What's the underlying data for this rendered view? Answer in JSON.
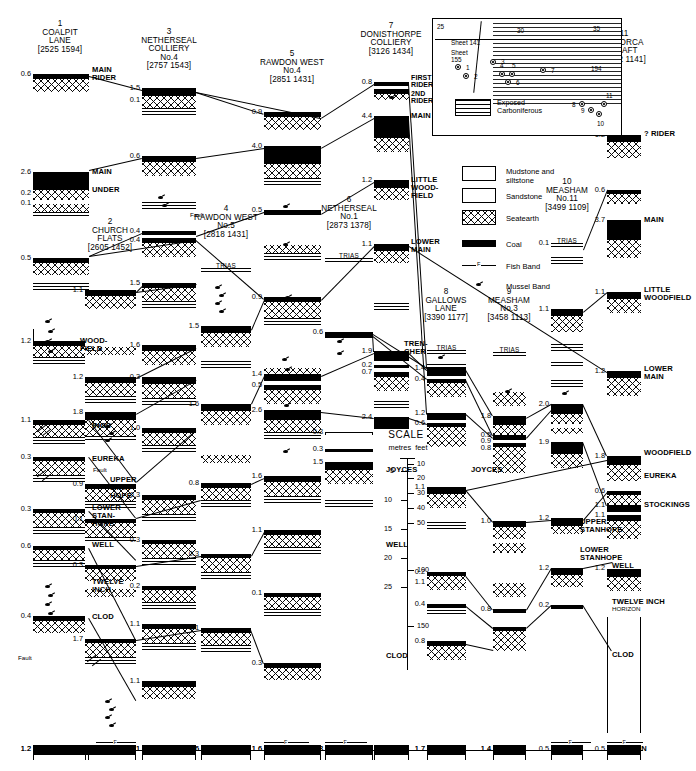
{
  "figure": {
    "type": "geological-seam-correlation-diagram",
    "scale": {
      "title": "SCALE",
      "unit_labels": [
        "metres",
        "feet"
      ],
      "metres_ticks": [
        "5",
        "10",
        "15",
        "20",
        "25"
      ],
      "feet_ticks": [
        "10",
        "20",
        "30",
        "40",
        "50",
        "100",
        "150"
      ]
    }
  },
  "legend": {
    "items": [
      {
        "key": "mudstone",
        "label": "Mudstone and\nsiltstone"
      },
      {
        "key": "sandstone",
        "label": "Sandstone"
      },
      {
        "key": "seatearth",
        "label": "Seatearth"
      },
      {
        "key": "coal",
        "label": "Coal"
      },
      {
        "key": "fish-band",
        "label": "Fish Band"
      },
      {
        "key": "mussel-band",
        "label": "Mussel Band"
      }
    ]
  },
  "map_inset": {
    "sheet_labels": [
      "Sheet 141",
      "Sheet 155"
    ],
    "grid_labels": [
      "25",
      "30",
      "35",
      "15",
      "194"
    ],
    "exposed_label": "Exposed\nCarboniferous",
    "site_numbers": [
      "1",
      "2",
      "3",
      "4",
      "5",
      "6",
      "7",
      "8",
      "9",
      "10",
      "11"
    ]
  },
  "columns": [
    {
      "no": "1",
      "name": "COALPIT\nLANE",
      "grid": "[2525 1594]",
      "trias": false,
      "top_values": [],
      "values": [
        "0.6",
        "2.6",
        "0.2",
        "0.1",
        "0.5",
        "1.2",
        "1.1",
        "0.3",
        "0.3",
        "0.6",
        "0.2",
        "0.4",
        "1.2"
      ]
    },
    {
      "no": "2",
      "name": "CHURCH\nFLATS",
      "grid": "[2605 1452]",
      "trias": false,
      "values": [
        "1.1",
        "1.2",
        "1.8",
        "0.9",
        "0.1",
        "0.3",
        "0.3",
        "0.9",
        "1.7",
        "0.7"
      ]
    },
    {
      "no": "3",
      "name": "NETHERSEAL\nCOLLIERY\nNo.4",
      "grid": "[2757 1543]",
      "trias": false,
      "values": [
        "1.5",
        "0.1",
        "0.6",
        "0.4",
        "0.4",
        "1.5",
        "1.6",
        "0.3",
        "1.0",
        "0.3",
        "0.3",
        "0.2",
        "1.1"
      ]
    },
    {
      "no": "4",
      "name": "RAWDON WEST\nNo.5",
      "grid": "[2818 1431]",
      "trias": true,
      "values": [
        "1.5",
        "1.6",
        "0.8",
        "0.3",
        "1.1",
        "0.3",
        "0.2",
        "1.6"
      ]
    },
    {
      "no": "5",
      "name": "RAWDON WEST\nNo.4",
      "grid": "[2851 1431]",
      "trias": false,
      "values": [
        "0.9",
        "4.0",
        "0.5",
        "0.9",
        "1.4",
        "0.5",
        "2.6",
        "1.6",
        "1.1",
        "0.1",
        "0.3",
        "1.6"
      ]
    },
    {
      "no": "6",
      "name": "NETHERSEAL\nNo.1",
      "grid": "[2873 1378]",
      "trias": true,
      "values": [
        "0.6",
        "0.3",
        "0.3",
        "1.5",
        "0.3"
      ]
    },
    {
      "no": "7",
      "name": "DONISTHORPE\nCOLLIERY",
      "grid": "[3126 1434]",
      "trias": false,
      "values": [
        "0.8",
        "4.4",
        "1.2",
        "1.1",
        "1.9",
        "0.2",
        "0.7",
        "2.4"
      ]
    },
    {
      "no": "8",
      "name": "GALLOWS\nLANE",
      "grid": "[3390 1177]",
      "trias": true,
      "values": [
        "1.4",
        "0.4",
        "1.2",
        "0.6",
        "1.1",
        "0.2",
        "1.1",
        "0.4",
        "0.8",
        "1.7"
      ]
    },
    {
      "no": "9",
      "name": "MEASHAM\nNo.3",
      "grid": "[3458 1113]",
      "trias": true,
      "values": [
        "1.8",
        "0.5",
        "0.9",
        "0.8",
        "1.0",
        "0.8",
        "1.4"
      ]
    },
    {
      "no": "10",
      "name": "MEASHAM\nNo.11",
      "grid": "[3499 1109]",
      "trias": true,
      "values": [
        "0.1",
        "1.1",
        "2.0",
        "1.9",
        "1.2",
        "1.2",
        "0.2",
        "0.5"
      ]
    },
    {
      "no": "11",
      "name": "MINORCA\nSHAFT",
      "grid": "[3552 1141]",
      "trias": false,
      "values": [
        "1.2",
        "0.6",
        "3.7",
        "1.1",
        "1.2",
        "1.8",
        "0.6",
        "1.1",
        "1.1",
        "1.2"
      ]
    }
  ],
  "seam_labels": {
    "col1": [
      "MAIN\nRIDER",
      "MAIN",
      "UNDER",
      "WOOD-\nFIELD",
      "STOCK-\nINGS",
      "EUREKA",
      "LOWER\nSTAN-\nHOPE",
      "WELL",
      "TWELVE\nINCH",
      "CLOD"
    ],
    "col2": [
      "UPPER\nSTAN-\nHOPE"
    ],
    "col6": [],
    "col7": [
      "FIRST\nRIDER",
      "2ND\nRIDER",
      "MAIN",
      "LITTLE\nWOOD-\nFIELD",
      "LOWER\nMAIN",
      "TREN-\nCHER"
    ],
    "col8": [
      "JOYCES"
    ],
    "col11": [
      "? RIDER",
      "MAIN",
      "LITTLE\nWOODFIELD",
      "LOWER\nMAIN",
      "WOODFIELD",
      "STOCKINGS",
      "EUREKA"
    ],
    "col10_right": [
      "UPPER\nSTANHOPE",
      "LOWER\nSTANHOPE",
      "WELL",
      "TWELVE INCH\nHORIZON",
      "CLOD"
    ],
    "base": "KILBURN",
    "mid_scale": [
      "JOYCES",
      "WELL",
      "CLOD"
    ],
    "fault": "Fault"
  },
  "base_values": [
    "1.2",
    "0.7",
    "1.1",
    "1.6",
    "1.6",
    "0.3",
    "1.7",
    "1.4",
    "0.5"
  ]
}
